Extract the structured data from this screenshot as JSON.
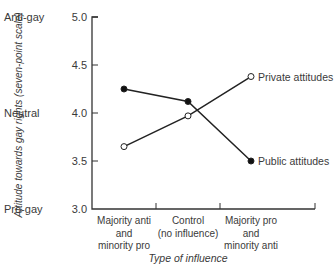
{
  "chart_data": {
    "type": "line",
    "title": "",
    "xlabel": "Type of influence",
    "ylabel": "Attitude towards gay rights (seven-point scale)",
    "ylim": [
      3.0,
      5.0
    ],
    "yticks": [
      "3.0",
      "3.5",
      "4.0",
      "4.5",
      "5.0"
    ],
    "ytick_annotations": {
      "5.0": "Anti-gay",
      "4.0": "Neutral",
      "3.0": "Pro-gay"
    },
    "categories": [
      [
        "Majority anti",
        "and",
        "minority pro"
      ],
      [
        "Control",
        "(no influence)"
      ],
      [
        "Majority pro",
        "and",
        "minority anti"
      ]
    ],
    "series": [
      {
        "name": "Private attitudes",
        "marker": "open-circle",
        "values": [
          3.65,
          3.97,
          4.38
        ]
      },
      {
        "name": "Public attitudes",
        "marker": "filled-circle",
        "values": [
          4.25,
          4.12,
          3.5
        ]
      }
    ],
    "grid": false,
    "legend": "inline labels at right end of lines"
  }
}
